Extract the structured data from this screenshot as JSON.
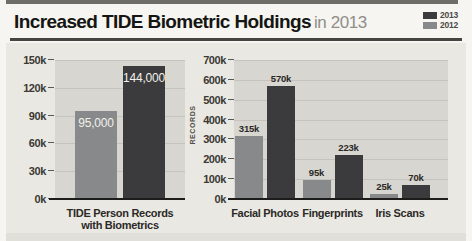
{
  "header": {
    "title_bold": "Increased TIDE Biometric Holdings",
    "title_suffix": "in 2013"
  },
  "legend": {
    "items": [
      {
        "label": "2013",
        "color": "#3b3b3d"
      },
      {
        "label": "2012",
        "color": "#87898a"
      }
    ]
  },
  "colors": {
    "panel_bg": "#eae8e2",
    "plot_bg": "#d8d6d0",
    "gridline": "#c5c3bd",
    "axis_line": "#1c1c1a",
    "bar_2013": "#3b3b3d",
    "bar_2012": "#87898a",
    "value_label_dark": "#2b2a27",
    "value_label_light": "#f2f1eb"
  },
  "chart_data": [
    {
      "type": "bar",
      "title": "",
      "categories": [
        "TIDE Person Records\nwith Biometrics"
      ],
      "series": [
        {
          "name": "2012",
          "color": "#87898a",
          "values": [
            95000
          ],
          "labels": [
            "95,000"
          ]
        },
        {
          "name": "2013",
          "color": "#3b3b3d",
          "values": [
            144000
          ],
          "labels": [
            "144,000"
          ]
        }
      ],
      "xlabel": "",
      "ylabel": "",
      "ylim": [
        0,
        150000
      ],
      "yticks": [
        "0k",
        "30k",
        "60k",
        "90k",
        "120k",
        "150k"
      ],
      "grid": true,
      "value_labels_position": "inside"
    },
    {
      "type": "bar",
      "title": "",
      "categories": [
        "Facial Photos",
        "Fingerprints",
        "Iris Scans"
      ],
      "series": [
        {
          "name": "2012",
          "color": "#87898a",
          "values": [
            315000,
            95000,
            25000
          ],
          "labels": [
            "315k",
            "95k",
            "25k"
          ]
        },
        {
          "name": "2013",
          "color": "#3b3b3d",
          "values": [
            570000,
            223000,
            70000
          ],
          "labels": [
            "570k",
            "223k",
            "70k"
          ]
        }
      ],
      "xlabel": "",
      "ylabel": "RECORDS",
      "ylim": [
        0,
        700000
      ],
      "yticks": [
        "0k",
        "100k",
        "200k",
        "300k",
        "400k",
        "500k",
        "600k",
        "700k"
      ],
      "grid": true,
      "value_labels_position": "above"
    }
  ]
}
